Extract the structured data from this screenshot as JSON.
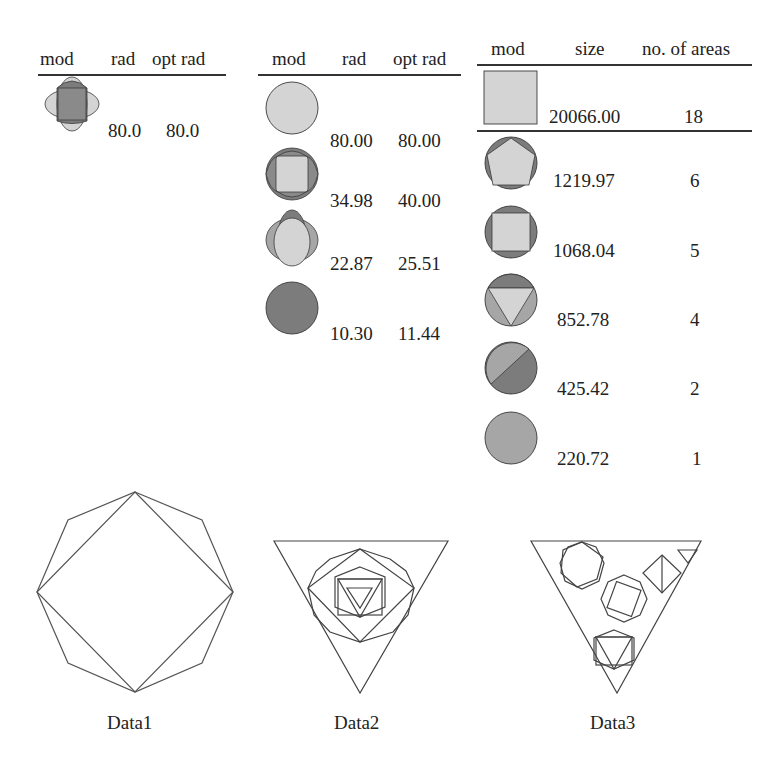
{
  "tables": [
    {
      "headers": [
        "mod",
        "rad",
        "opt rad"
      ],
      "rows": [
        {
          "icon": "four-lobe-shape",
          "rad": "80.0",
          "opt_rad": "80.0"
        }
      ]
    },
    {
      "headers": [
        "mod",
        "rad",
        "opt rad"
      ],
      "rows": [
        {
          "icon": "light-circle",
          "rad": "80.00",
          "opt_rad": "80.00"
        },
        {
          "icon": "square-four-lobes",
          "rad": "34.98",
          "opt_rad": "40.00"
        },
        {
          "icon": "oval-four-lobes",
          "rad": "22.87",
          "opt_rad": "25.51"
        },
        {
          "icon": "dark-circle",
          "rad": "10.30",
          "opt_rad": "11.44"
        }
      ]
    },
    {
      "headers": [
        "mod",
        "size",
        "no. of areas"
      ],
      "rows": [
        {
          "icon": "light-square",
          "size": "20066.00",
          "areas": "18"
        },
        {
          "icon": "pentagon-in-circle",
          "size": "1219.97",
          "areas": "6"
        },
        {
          "icon": "square-in-circle",
          "size": "1068.04",
          "areas": "5"
        },
        {
          "icon": "triangle-in-circle",
          "size": "852.78",
          "areas": "4"
        },
        {
          "icon": "split-circle",
          "size": "425.42",
          "areas": "2"
        },
        {
          "icon": "medium-circle",
          "size": "220.72",
          "areas": "1"
        }
      ]
    }
  ],
  "captions": [
    "Data1",
    "Data2",
    "Data3"
  ],
  "colors": {
    "light": "#d4d4d4",
    "medium": "#a6a6a6",
    "dark": "#7c7c7c",
    "stroke": "#3a3a3a"
  }
}
